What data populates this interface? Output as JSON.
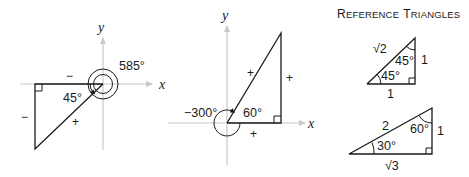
{
  "title": {
    "cap1": "R",
    "rest1": "EFERENCE",
    "cap2": "T",
    "rest2": "RIANGLES"
  },
  "diagram1": {
    "x_label": "x",
    "y_label": "y",
    "angle_label": "585°",
    "reference_angle": "45°",
    "sign_adjacent": "−",
    "sign_opposite": "−",
    "sign_hypotenuse": "+"
  },
  "diagram2": {
    "x_label": "x",
    "y_label": "y",
    "angle_label": "−300°",
    "reference_angle": "60°",
    "sign_adjacent": "+",
    "sign_opposite": "+",
    "sign_hypotenuse": "+"
  },
  "ref_triangle_45": {
    "hypotenuse": "√2",
    "top_angle": "45°",
    "bottom_angle": "45°",
    "vertical_side": "1",
    "horizontal_side": "1"
  },
  "ref_triangle_30_60": {
    "hypotenuse": "2",
    "top_angle": "60°",
    "bottom_angle": "30°",
    "vertical_side": "1",
    "horizontal_side": "√3"
  },
  "colors": {
    "axis": "#c8c8c8",
    "line": "#1a1a1a",
    "background": "#ffffff"
  }
}
